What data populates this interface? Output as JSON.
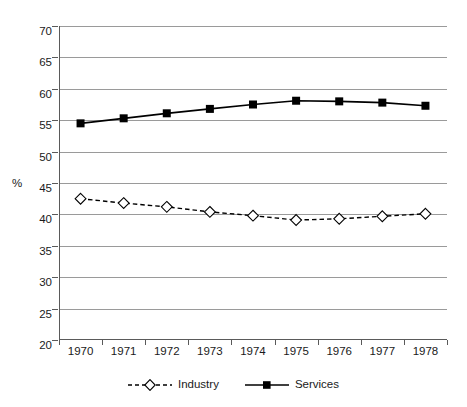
{
  "chart_data": {
    "type": "line",
    "title": "",
    "subtitle": "",
    "xlabel": "",
    "ylabel": "%",
    "categories": [
      "1970",
      "1971",
      "1972",
      "1973",
      "1974",
      "1975",
      "1976",
      "1977",
      "1978"
    ],
    "series": [
      {
        "name": "Industry",
        "values": [
          42.5,
          41.8,
          41.2,
          40.4,
          39.8,
          39.1,
          39.3,
          39.7,
          40.1
        ],
        "marker": "open-diamond",
        "line_style": "dashed",
        "color": "#000000"
      },
      {
        "name": "Services",
        "values": [
          54.5,
          55.3,
          56.1,
          56.8,
          57.5,
          58.1,
          58.0,
          57.8,
          57.3
        ],
        "marker": "filled-square",
        "line_style": "solid",
        "color": "#000000"
      }
    ],
    "ylim": [
      20,
      70
    ],
    "ytick_step": 5,
    "yticks": [
      "70",
      "65",
      "60",
      "55",
      "50",
      "45",
      "40",
      "35",
      "30",
      "25",
      "20"
    ],
    "grid": true,
    "legend_position": "bottom",
    "gridline_color": "#9a9a9a",
    "axis_color": "#5a5a5a",
    "background": "#ffffff"
  },
  "legend": {
    "items": [
      {
        "label": "Industry"
      },
      {
        "label": "Services"
      }
    ]
  }
}
